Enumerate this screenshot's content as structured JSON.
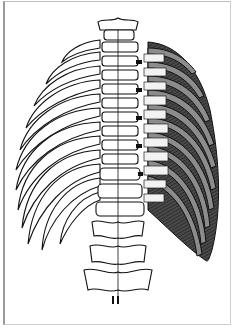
{
  "figure": {
    "left_side": "bare ribs (line drawing)",
    "right_side": "ribs with intercostal muscles shaded",
    "colors": {
      "line": "#111111",
      "muscle_dark": "#3a3a3a",
      "rib_grey": "#8c8c8c",
      "tendon_light": "#f2f2f2",
      "frame": "#9a9a9a",
      "background": "#ffffff"
    },
    "rib_pairs": 12
  }
}
